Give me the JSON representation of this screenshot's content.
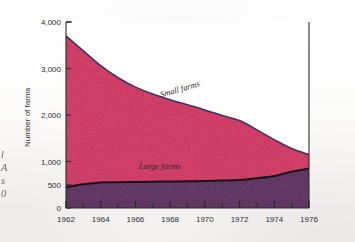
{
  "figure": {
    "background_color": "#fdfdfd",
    "caption_fragment_lines": [
      "l",
      "A",
      "s",
      "0"
    ]
  },
  "chart_data": {
    "type": "area",
    "stacked": true,
    "title": "",
    "subtitle": "",
    "xlabel": "",
    "ylabel": "Number of farms",
    "x": [
      1962,
      1963,
      1964,
      1965,
      1966,
      1967,
      1968,
      1969,
      1970,
      1971,
      1972,
      1973,
      1974,
      1975,
      1976
    ],
    "xlim": [
      1962,
      1976
    ],
    "ylim": [
      0,
      4000
    ],
    "ytick_values": [
      0,
      500,
      1000,
      2000,
      3000,
      4000
    ],
    "ytick_labels": [
      "0",
      "500",
      "1,000",
      "2,000",
      "3,000",
      "4,000"
    ],
    "xtick_values": [
      1962,
      1964,
      1966,
      1968,
      1970,
      1972,
      1974,
      1976
    ],
    "xtick_labels": [
      "1962",
      "1964",
      "1966",
      "1968",
      "1970",
      "1972",
      "1974",
      "1976"
    ],
    "minor_xticks_every": 1,
    "grid": false,
    "legend": "inline-annotations",
    "series": [
      {
        "name": "Large farms",
        "label": "Large farms",
        "color": "#5b2b5e",
        "line_color": "#17131a",
        "values": [
          450,
          510,
          548,
          556,
          560,
          565,
          570,
          575,
          580,
          590,
          600,
          640,
          690,
          780,
          850
        ]
      },
      {
        "name": "Small farms",
        "label": "Small farms",
        "color": "#ce3360",
        "line_color": "#3a3468",
        "total_values": [
          3700,
          3380,
          3060,
          2800,
          2600,
          2450,
          2330,
          2220,
          2110,
          1990,
          1880,
          1680,
          1470,
          1280,
          1150
        ],
        "values": [
          3250,
          2870,
          2512,
          2244,
          2040,
          1885,
          1760,
          1645,
          1530,
          1400,
          1280,
          1040,
          780,
          500,
          300
        ]
      }
    ],
    "annotations": [
      {
        "text": "Small farms",
        "x": 1968.6,
        "y": 2500,
        "rotation": -16
      },
      {
        "text": "Large farms",
        "x": 1967.4,
        "y": 830,
        "rotation": 0
      }
    ]
  },
  "axes": {
    "y_axis_title": "Number of farms",
    "y_tick_labels": [
      "4,000",
      "3,000",
      "2,000",
      "1,000",
      "500",
      "0"
    ],
    "x_tick_labels": [
      "1962",
      "1964",
      "1966",
      "1968",
      "1970",
      "1972",
      "1974",
      "1976"
    ]
  }
}
